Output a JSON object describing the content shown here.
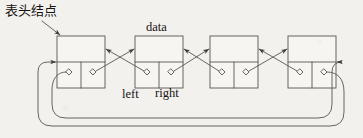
{
  "figure": {
    "background_color": "#f3f1ee",
    "ink_color": "#3c3a36",
    "annotations": {
      "head_node": "表头结点",
      "data": "data",
      "left": "left",
      "right": "right"
    },
    "nodes": [
      {
        "id": "node-1",
        "x": 57,
        "y": 36,
        "width": 48,
        "height": 52,
        "role": "header-node",
        "cells": {
          "data": "",
          "left": "pointer",
          "right": "pointer"
        }
      },
      {
        "id": "node-2",
        "x": 135,
        "y": 36,
        "width": 48,
        "height": 52,
        "role": "element-node",
        "cells": {
          "data": "",
          "left": "pointer",
          "right": "pointer"
        }
      },
      {
        "id": "node-3",
        "x": 210,
        "y": 36,
        "width": 48,
        "height": 52,
        "role": "element-node",
        "cells": {
          "data": "",
          "left": "pointer",
          "right": "pointer"
        }
      },
      {
        "id": "node-4",
        "x": 288,
        "y": 36,
        "width": 48,
        "height": 52,
        "role": "element-node",
        "cells": {
          "data": "",
          "left": "pointer",
          "right": "pointer"
        }
      }
    ],
    "pointer_marks": [
      {
        "node": "node-1",
        "field": "left",
        "cx": 69,
        "cy": 72
      },
      {
        "node": "node-1",
        "field": "right",
        "cx": 93,
        "cy": 72
      },
      {
        "node": "node-2",
        "field": "left",
        "cx": 147,
        "cy": 72
      },
      {
        "node": "node-2",
        "field": "right",
        "cx": 171,
        "cy": 72
      },
      {
        "node": "node-3",
        "field": "left",
        "cx": 222,
        "cy": 72
      },
      {
        "node": "node-3",
        "field": "right",
        "cx": 246,
        "cy": 72
      },
      {
        "node": "node-4",
        "field": "left",
        "cx": 300,
        "cy": 72
      },
      {
        "node": "node-4",
        "field": "right",
        "cx": 324,
        "cy": 72
      }
    ],
    "links": [
      {
        "from": "node-1.right",
        "to": "node-2.left-edge",
        "kind": "successor"
      },
      {
        "from": "node-2.left",
        "to": "node-1.right-edge",
        "kind": "predecessor"
      },
      {
        "from": "node-2.right",
        "to": "node-3.left-edge",
        "kind": "successor"
      },
      {
        "from": "node-3.left",
        "to": "node-2.right-edge",
        "kind": "predecessor"
      },
      {
        "from": "node-3.right",
        "to": "node-4.left-edge",
        "kind": "successor"
      },
      {
        "from": "node-4.left",
        "to": "node-3.right-edge",
        "kind": "predecessor"
      },
      {
        "from": "node-4.right",
        "to": "node-1.left-edge",
        "kind": "wrap-around-successor"
      },
      {
        "from": "node-1.left",
        "to": "node-4.right-edge",
        "kind": "wrap-around-predecessor"
      }
    ]
  }
}
